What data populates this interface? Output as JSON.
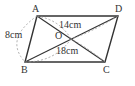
{
  "diagram": {
    "shape": "parallelogram",
    "vertices": {
      "A": "A",
      "B": "B",
      "C": "C",
      "D": "D",
      "O": "O"
    },
    "measures": {
      "AB": "8cm",
      "AC_half": "14cm",
      "BD_half": "18cm"
    },
    "colors": {
      "line": "#333333",
      "dashed": "#999999"
    }
  }
}
